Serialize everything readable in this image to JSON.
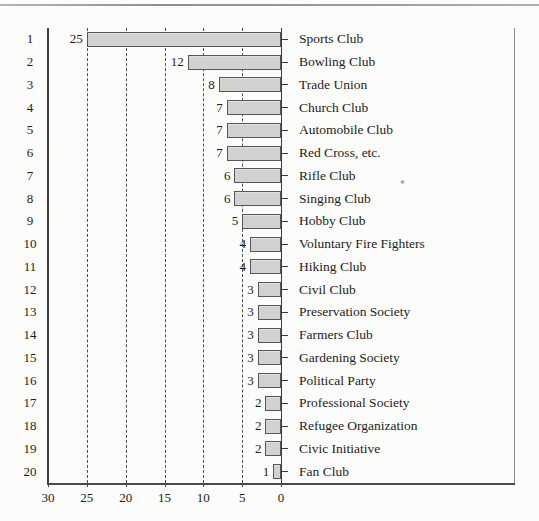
{
  "chart_data": {
    "type": "bar",
    "orientation": "horizontal",
    "value_axis_reversed": true,
    "title": "",
    "xlabel": "",
    "ylabel": "",
    "xlim": [
      30,
      0
    ],
    "x_ticks": [
      "30",
      "25",
      "20",
      "15",
      "10",
      "5",
      "0"
    ],
    "x_tick_values": [
      30,
      25,
      20,
      15,
      10,
      5,
      0
    ],
    "gridline_values": [
      25,
      20,
      15,
      10,
      5
    ],
    "grid_style": "dashed",
    "legend": null,
    "value_labels_shown": true,
    "ranks": [
      "1",
      "2",
      "3",
      "4",
      "5",
      "6",
      "7",
      "8",
      "9",
      "10",
      "11",
      "12",
      "13",
      "14",
      "15",
      "16",
      "17",
      "18",
      "19",
      "20"
    ],
    "categories": [
      "Sports Club",
      "Bowling Club",
      "Trade Union",
      "Church Club",
      "Automobile Club",
      "Red Cross, etc.",
      "Rifle Club",
      "Singing Club",
      "Hobby Club",
      "Voluntary Fire Fighters",
      "Hiking Club",
      "Civil Club",
      "Preservation Society",
      "Farmers Club",
      "Gardening Society",
      "Political Party",
      "Professional Society",
      "Refugee Organization",
      "Civic Initiative",
      "Fan Club"
    ],
    "values": [
      25,
      12,
      8,
      7,
      7,
      7,
      6,
      6,
      5,
      4,
      4,
      3,
      3,
      3,
      3,
      3,
      2,
      2,
      2,
      1
    ],
    "colors": {
      "bar_fill": "#d2d2d0",
      "bar_border": "#55555a",
      "axis": "#3c3c3c",
      "grid": "#4d4d4d",
      "text": "#1c1c1c",
      "background": "#fcfcfa",
      "top_rule": "#9a9a9a"
    }
  }
}
